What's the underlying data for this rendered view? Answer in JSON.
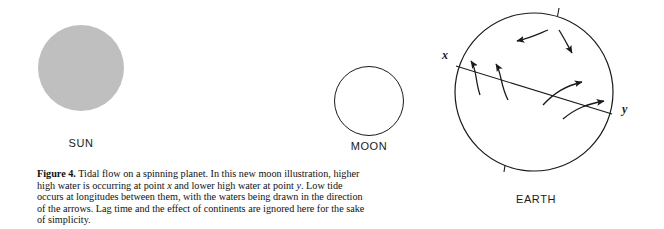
{
  "figure": {
    "number_label": "Figure 4.",
    "caption_parts": {
      "p1": " Tidal flow on a spinning planet. In this new moon illustration, higher high water is occurring at point ",
      "x1": "x",
      "p2": " and lower high water at point ",
      "y1": "y",
      "p3": ". Low tide occurs at longitudes between them, with the waters being drawn in the direction of the arrows. Lag time and the effect of continents are ignored here for the sake of simplicity."
    }
  },
  "bodies": {
    "sun": {
      "label": "SUN",
      "fill_color": "#bfbfbf",
      "style": "filled-gray-disc"
    },
    "moon": {
      "label": "MOON",
      "fill_color": "#ffffff",
      "stroke_color": "#1a1a1a",
      "style": "outlined-circle"
    },
    "earth": {
      "label": "EARTH",
      "fill_color": "#ffffff",
      "stroke_color": "#1a1a1a",
      "style": "outlined-circle-with-tidal-axis",
      "point_x_label": "x",
      "point_y_label": "y",
      "tidal_axis_description": "diagonal line from point x on upper-left rim to point y on right rim",
      "arrow_count": 6,
      "rotation_axis_ticks": 2
    }
  }
}
